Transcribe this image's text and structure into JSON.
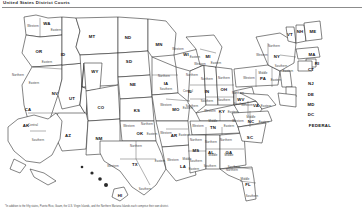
{
  "title": "United States District Courts",
  "footnote": "*In addition to the fifty states, Puerto Rico, Guam, the U.S. Virgin Islands, and the Northern Mariana Islands each comprise their own district.",
  "map": {
    "name": "us-district-courts-map",
    "federal_label": "FEDERAL",
    "dc_label": "DC",
    "insets": [
      {
        "abbr": "AK",
        "name": "Alaska"
      },
      {
        "abbr": "HI",
        "name": "Hawaii"
      }
    ],
    "states": [
      {
        "abbr": "WA",
        "x": 47,
        "y": 14,
        "divisions": [
          {
            "t": "Western",
            "x": 33,
            "y": 17
          },
          {
            "t": "Eastern",
            "x": 56,
            "y": 21
          }
        ]
      },
      {
        "abbr": "OR",
        "x": 39,
        "y": 42,
        "divisions": [
          {
            "t": "Eastern",
            "x": 47,
            "y": 53
          }
        ]
      },
      {
        "abbr": "CA",
        "x": 28,
        "y": 100,
        "divisions": [
          {
            "t": "Northern",
            "x": 18,
            "y": 66
          },
          {
            "t": "Eastern",
            "x": 34,
            "y": 74
          },
          {
            "t": "Central",
            "x": 33,
            "y": 116
          },
          {
            "t": "Southern",
            "x": 38,
            "y": 131
          }
        ]
      },
      {
        "abbr": "NV",
        "x": 55,
        "y": 84,
        "divisions": []
      },
      {
        "abbr": "ID",
        "x": 63,
        "y": 45,
        "divisions": []
      },
      {
        "abbr": "MT",
        "x": 92,
        "y": 27,
        "divisions": []
      },
      {
        "abbr": "WY",
        "x": 95,
        "y": 62,
        "divisions": []
      },
      {
        "abbr": "UT",
        "x": 72,
        "y": 89,
        "divisions": []
      },
      {
        "abbr": "CO",
        "x": 101,
        "y": 98,
        "divisions": []
      },
      {
        "abbr": "AZ",
        "x": 68,
        "y": 126,
        "divisions": []
      },
      {
        "abbr": "NM",
        "x": 99,
        "y": 129,
        "divisions": []
      },
      {
        "abbr": "ND",
        "x": 128,
        "y": 28,
        "divisions": []
      },
      {
        "abbr": "SD",
        "x": 129,
        "y": 52,
        "divisions": []
      },
      {
        "abbr": "NE",
        "x": 133,
        "y": 75,
        "divisions": []
      },
      {
        "abbr": "KS",
        "x": 137,
        "y": 101,
        "divisions": []
      },
      {
        "abbr": "OK",
        "x": 140,
        "y": 124,
        "divisions": [
          {
            "t": "Western",
            "x": 129,
            "y": 117
          },
          {
            "t": "Northern",
            "x": 147,
            "y": 115
          },
          {
            "t": "Eastern",
            "x": 152,
            "y": 125
          }
        ]
      },
      {
        "abbr": "TX",
        "x": 135,
        "y": 155,
        "divisions": [
          {
            "t": "Northern",
            "x": 136,
            "y": 137
          },
          {
            "t": "Western",
            "x": 113,
            "y": 157
          },
          {
            "t": "Eastern",
            "x": 160,
            "y": 152
          },
          {
            "t": "Southern",
            "x": 145,
            "y": 180
          }
        ]
      },
      {
        "abbr": "MN",
        "x": 159,
        "y": 35,
        "divisions": []
      },
      {
        "abbr": "IA",
        "x": 166,
        "y": 74,
        "divisions": [
          {
            "t": "Northern",
            "x": 164,
            "y": 67
          },
          {
            "t": "Southern",
            "x": 166,
            "y": 80
          }
        ]
      },
      {
        "abbr": "MO",
        "x": 176,
        "y": 100,
        "divisions": [
          {
            "t": "Western",
            "x": 166,
            "y": 96
          },
          {
            "t": "Eastern",
            "x": 188,
            "y": 99
          }
        ]
      },
      {
        "abbr": "AR",
        "x": 174,
        "y": 126,
        "divisions": [
          {
            "t": "Western",
            "x": 166,
            "y": 124
          },
          {
            "t": "Eastern",
            "x": 184,
            "y": 126
          }
        ]
      },
      {
        "abbr": "LA",
        "x": 183,
        "y": 157,
        "divisions": [
          {
            "t": "Western",
            "x": 173,
            "y": 151
          },
          {
            "t": "Middle",
            "x": 187,
            "y": 150
          },
          {
            "t": "Eastern",
            "x": 194,
            "y": 160
          }
        ]
      },
      {
        "abbr": "WI",
        "x": 186,
        "y": 45,
        "divisions": [
          {
            "t": "Western",
            "x": 178,
            "y": 40
          },
          {
            "t": "Eastern",
            "x": 195,
            "y": 48
          }
        ]
      },
      {
        "abbr": "IL",
        "x": 190,
        "y": 82,
        "divisions": [
          {
            "t": "Northern",
            "x": 192,
            "y": 66
          },
          {
            "t": "Central",
            "x": 188,
            "y": 82
          },
          {
            "t": "Southern",
            "x": 192,
            "y": 97
          }
        ]
      },
      {
        "abbr": "MI",
        "x": 208,
        "y": 47,
        "divisions": [
          {
            "t": "Western",
            "x": 200,
            "y": 55
          },
          {
            "t": "Eastern",
            "x": 216,
            "y": 54
          }
        ]
      },
      {
        "abbr": "IN",
        "x": 207,
        "y": 82,
        "divisions": [
          {
            "t": "Northern",
            "x": 207,
            "y": 70
          },
          {
            "t": "Southern",
            "x": 207,
            "y": 92
          }
        ]
      },
      {
        "abbr": "OH",
        "x": 224,
        "y": 80,
        "divisions": [
          {
            "t": "Northern",
            "x": 224,
            "y": 69
          },
          {
            "t": "Southern",
            "x": 224,
            "y": 91
          }
        ]
      },
      {
        "abbr": "KY",
        "x": 222,
        "y": 102,
        "divisions": [
          {
            "t": "Western",
            "x": 210,
            "y": 102
          },
          {
            "t": "Eastern",
            "x": 233,
            "y": 103
          }
        ]
      },
      {
        "abbr": "TN",
        "x": 213,
        "y": 118,
        "divisions": [
          {
            "t": "Western",
            "x": 198,
            "y": 117
          },
          {
            "t": "Middle",
            "x": 213,
            "y": 112
          },
          {
            "t": "Eastern",
            "x": 229,
            "y": 117
          }
        ]
      },
      {
        "abbr": "MS",
        "x": 196,
        "y": 141,
        "divisions": [
          {
            "t": "Northern",
            "x": 196,
            "y": 131
          },
          {
            "t": "Southern",
            "x": 196,
            "y": 152
          }
        ]
      },
      {
        "abbr": "AL",
        "x": 211,
        "y": 143,
        "divisions": [
          {
            "t": "Northern",
            "x": 211,
            "y": 133
          },
          {
            "t": "Middle",
            "x": 213,
            "y": 146
          },
          {
            "t": "Southern",
            "x": 210,
            "y": 157
          }
        ]
      },
      {
        "abbr": "GA",
        "x": 229,
        "y": 143,
        "divisions": [
          {
            "t": "Northern",
            "x": 226,
            "y": 131
          },
          {
            "t": "Middle",
            "x": 229,
            "y": 146
          },
          {
            "t": "Southern",
            "x": 234,
            "y": 158
          }
        ]
      },
      {
        "abbr": "FL",
        "x": 248,
        "y": 175,
        "divisions": [
          {
            "t": "Northern",
            "x": 232,
            "y": 161
          },
          {
            "t": "Middle",
            "x": 245,
            "y": 170
          },
          {
            "t": "Southern",
            "x": 252,
            "y": 187
          }
        ]
      },
      {
        "abbr": "SC",
        "x": 250,
        "y": 128,
        "divisions": []
      },
      {
        "abbr": "NC",
        "x": 251,
        "y": 112,
        "divisions": [
          {
            "t": "Western",
            "x": 238,
            "y": 112
          },
          {
            "t": "Middle",
            "x": 251,
            "y": 108
          },
          {
            "t": "Eastern",
            "x": 264,
            "y": 113
          }
        ]
      },
      {
        "abbr": "VA",
        "x": 256,
        "y": 96,
        "divisions": [
          {
            "t": "Western",
            "x": 247,
            "y": 96
          },
          {
            "t": "Eastern",
            "x": 266,
            "y": 97
          }
        ]
      },
      {
        "abbr": "WV",
        "x": 241,
        "y": 90,
        "divisions": [
          {
            "t": "Northern",
            "x": 238,
            "y": 84
          },
          {
            "t": "Southern",
            "x": 240,
            "y": 95
          }
        ]
      },
      {
        "abbr": "PA",
        "x": 263,
        "y": 69,
        "divisions": [
          {
            "t": "Western",
            "x": 249,
            "y": 69
          },
          {
            "t": "Middle",
            "x": 263,
            "y": 64
          },
          {
            "t": "Eastern",
            "x": 276,
            "y": 71
          }
        ]
      },
      {
        "abbr": "NY",
        "x": 277,
        "y": 47,
        "divisions": [
          {
            "t": "Northern",
            "x": 274,
            "y": 37
          },
          {
            "t": "Western",
            "x": 262,
            "y": 46
          },
          {
            "t": "Southern",
            "x": 281,
            "y": 57
          },
          {
            "t": "Eastern",
            "x": 288,
            "y": 62
          }
        ]
      },
      {
        "abbr": "VT",
        "x": 290,
        "y": 25,
        "divisions": []
      },
      {
        "abbr": "NH",
        "x": 300,
        "y": 22,
        "divisions": []
      },
      {
        "abbr": "ME",
        "x": 313,
        "y": 22,
        "divisions": []
      },
      {
        "abbr": "MA",
        "x": 312,
        "y": 45,
        "divisions": []
      },
      {
        "abbr": "RI",
        "x": 317,
        "y": 54,
        "divisions": []
      },
      {
        "abbr": "CT",
        "x": 311,
        "y": 60,
        "divisions": []
      },
      {
        "abbr": "NJ",
        "x": 311,
        "y": 74,
        "divisions": []
      },
      {
        "abbr": "DE",
        "x": 311,
        "y": 85,
        "divisions": []
      },
      {
        "abbr": "MD",
        "x": 311,
        "y": 95,
        "divisions": []
      }
    ]
  }
}
